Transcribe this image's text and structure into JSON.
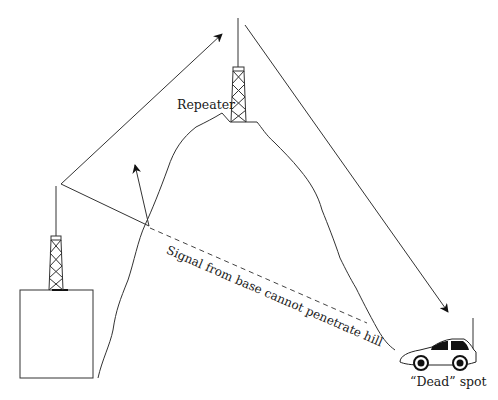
{
  "diagram": {
    "labels": {
      "repeater": "Repeater",
      "signal_blocked": "Signal from base cannot penetrate hill",
      "dead_spot": "“Dead” spot"
    },
    "elements": {
      "base_station": "base-building-with-tower",
      "repeater": "repeater-tower-on-hilltop",
      "hill": "hill",
      "vehicle": "car-with-antenna"
    },
    "colors": {
      "stroke": "#222222",
      "background": "#ffffff"
    }
  }
}
